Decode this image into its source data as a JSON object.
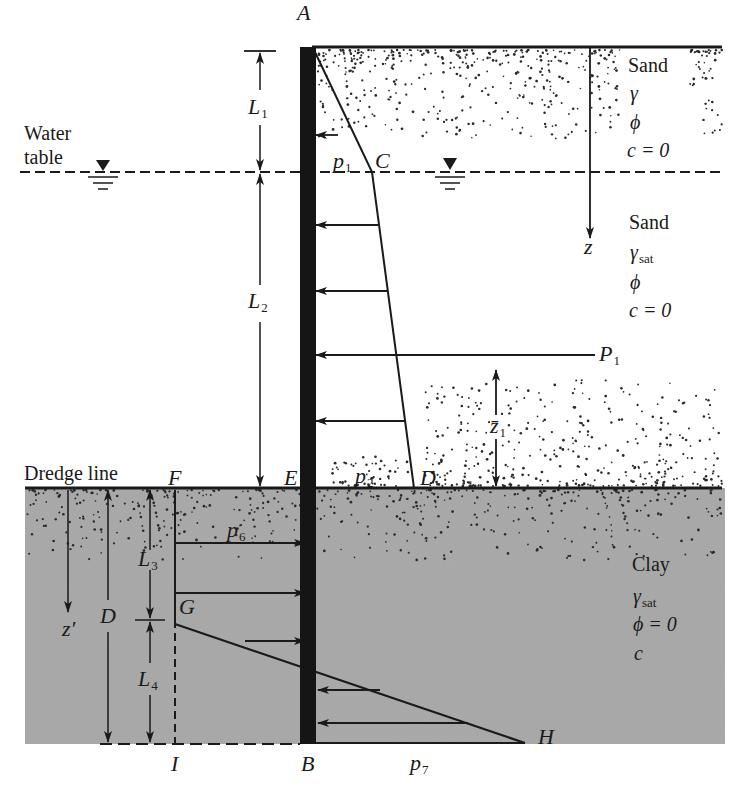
{
  "figure": {
    "points": {
      "A": "A",
      "B": "B",
      "C": "C",
      "D": "D",
      "E": "E",
      "F": "F",
      "G": "G",
      "H": "H",
      "I": "I"
    },
    "dimensions": {
      "L1": {
        "base": "L",
        "sub": "1"
      },
      "L2": {
        "base": "L",
        "sub": "2"
      },
      "L3": {
        "base": "L",
        "sub": "3"
      },
      "L4": {
        "base": "L",
        "sub": "4"
      },
      "D": "D",
      "z": "z",
      "z_prime": "z′",
      "z1_bar": {
        "base": "z̄",
        "sub": "1"
      }
    },
    "pressures": {
      "p1": {
        "base": "p",
        "sub": "1"
      },
      "p2": {
        "base": "p",
        "sub": "2"
      },
      "p6": {
        "base": "p",
        "sub": "6"
      },
      "p7": {
        "base": "p",
        "sub": "7"
      },
      "P1": {
        "base": "P",
        "sub": "1"
      }
    },
    "labels": {
      "water_table_line1": "Water",
      "water_table_line2": "table",
      "dredge_line": "Dredge line"
    },
    "layers": {
      "sand_dry": {
        "name": "Sand",
        "unit_weight": "γ",
        "friction": "ϕ",
        "cohesion": "c = 0"
      },
      "sand_sat": {
        "name": "Sand",
        "unit_weight": "γ",
        "unit_weight_sub": "sat",
        "friction": "ϕ",
        "cohesion": "c = 0"
      },
      "clay": {
        "name": "Clay",
        "unit_weight": "γ",
        "unit_weight_sub": "sat",
        "friction": "ϕ = 0",
        "cohesion": "c"
      }
    },
    "colors": {
      "ink": "#1a1a1a",
      "clay_fill": "#a9a9a9",
      "sheet_pile": "#151515",
      "background": "#ffffff"
    }
  }
}
